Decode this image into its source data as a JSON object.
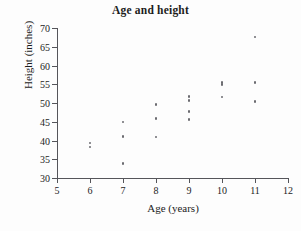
{
  "chart_data": {
    "type": "scatter",
    "title": "Age and height",
    "xlabel": "Age (years)",
    "ylabel": "Height (inches)",
    "xlim": [
      5,
      12
    ],
    "ylim": [
      30,
      70
    ],
    "xticks": [
      5,
      6,
      7,
      8,
      9,
      10,
      11,
      12
    ],
    "yticks": [
      30,
      35,
      40,
      45,
      50,
      55,
      60,
      65,
      70
    ],
    "xtick_labels": [
      "5",
      "6",
      "7",
      "8",
      "9",
      "10",
      "11",
      "12"
    ],
    "ytick_labels": [
      "30",
      "35",
      "40",
      "45",
      "50",
      "55",
      "60",
      "65",
      "70"
    ],
    "grid": false,
    "legend": false,
    "marker_color": "#6b6b70",
    "axis_color": "#55555a",
    "text_color": "#1c1c1c",
    "points": [
      {
        "x": 6,
        "y": 38.3
      },
      {
        "x": 6,
        "y": 39.3
      },
      {
        "x": 7,
        "y": 33.9
      },
      {
        "x": 7,
        "y": 41.0
      },
      {
        "x": 7,
        "y": 44.9
      },
      {
        "x": 8,
        "y": 40.9
      },
      {
        "x": 8,
        "y": 45.8
      },
      {
        "x": 8,
        "y": 49.6
      },
      {
        "x": 9,
        "y": 45.6
      },
      {
        "x": 9,
        "y": 47.7
      },
      {
        "x": 9,
        "y": 50.6
      },
      {
        "x": 9,
        "y": 51.7
      },
      {
        "x": 10,
        "y": 51.6
      },
      {
        "x": 10,
        "y": 54.9
      },
      {
        "x": 10,
        "y": 55.5
      },
      {
        "x": 11,
        "y": 50.4
      },
      {
        "x": 11,
        "y": 55.5
      },
      {
        "x": 11,
        "y": 67.6
      }
    ]
  }
}
